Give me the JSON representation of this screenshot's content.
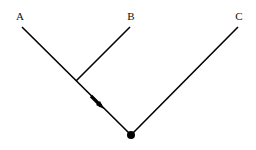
{
  "diagram": {
    "type": "tree",
    "labels": {
      "a": "A",
      "b": "B",
      "c": "C"
    },
    "colors": {
      "line": "#000000",
      "background": "#ffffff"
    },
    "edges": [
      {
        "from": "A",
        "to": "root",
        "note": "with arrow toward root"
      },
      {
        "from": "B",
        "to": "A-branch junction"
      },
      {
        "from": "C",
        "to": "root"
      }
    ],
    "root": {
      "marker": "filled-circle"
    }
  }
}
